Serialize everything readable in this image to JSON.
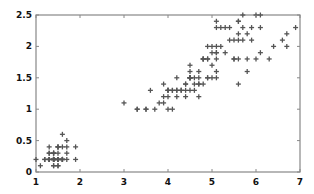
{
  "chart_data": {
    "type": "scatter",
    "title": "",
    "xlabel": "",
    "ylabel": "",
    "xlim": [
      1,
      7
    ],
    "ylim": [
      0,
      2.5
    ],
    "grid": false,
    "legend": null,
    "marker": "+",
    "marker_color": "#555555",
    "axis_color": "#888888",
    "x_ticks": [
      1,
      2,
      3,
      4,
      5,
      6,
      7
    ],
    "x_tick_labels": [
      "1",
      "2",
      "3",
      "4",
      "5",
      "6",
      "7"
    ],
    "y_ticks": [
      0,
      0.5,
      1,
      1.5,
      2,
      2.5
    ],
    "y_tick_labels": [
      "0",
      "0.5",
      "1",
      "1.5",
      "2",
      "2.5"
    ],
    "series": [
      {
        "name": "points",
        "x": [
          1.4,
          1.4,
          1.3,
          1.5,
          1.4,
          1.7,
          1.4,
          1.5,
          1.4,
          1.5,
          1.5,
          1.6,
          1.4,
          1.1,
          1.2,
          1.5,
          1.3,
          1.4,
          1.7,
          1.5,
          1.7,
          1.5,
          1.0,
          1.7,
          1.9,
          1.6,
          1.6,
          1.5,
          1.4,
          1.6,
          1.6,
          1.5,
          1.5,
          1.4,
          1.5,
          1.2,
          1.3,
          1.4,
          1.3,
          1.5,
          1.3,
          1.3,
          1.3,
          1.6,
          1.9,
          1.4,
          1.6,
          1.4,
          1.5,
          1.4,
          4.7,
          4.5,
          4.9,
          4.0,
          4.6,
          4.5,
          4.7,
          3.3,
          4.6,
          3.9,
          3.5,
          4.2,
          4.0,
          4.7,
          3.6,
          4.4,
          4.5,
          4.1,
          4.5,
          3.9,
          4.8,
          4.0,
          4.9,
          4.7,
          4.3,
          4.4,
          4.8,
          5.0,
          4.5,
          3.5,
          3.8,
          3.7,
          3.9,
          5.1,
          4.5,
          4.5,
          4.7,
          4.4,
          4.1,
          4.0,
          4.4,
          4.6,
          4.0,
          3.3,
          4.2,
          4.2,
          4.2,
          4.3,
          3.0,
          4.1,
          6.0,
          5.1,
          5.9,
          5.6,
          5.8,
          6.6,
          4.5,
          6.3,
          5.8,
          6.1,
          5.1,
          5.3,
          5.5,
          5.0,
          5.1,
          5.3,
          5.5,
          6.7,
          6.9,
          5.0,
          5.7,
          4.9,
          6.7,
          4.9,
          5.7,
          6.0,
          4.8,
          4.9,
          5.6,
          5.8,
          6.1,
          6.4,
          5.6,
          5.1,
          5.6,
          6.1,
          5.6,
          5.5,
          4.8,
          5.4,
          5.6,
          5.1,
          5.1,
          5.9,
          5.7,
          5.2,
          5.0,
          5.2,
          5.4,
          5.1
        ],
        "y": [
          0.2,
          0.2,
          0.2,
          0.2,
          0.2,
          0.4,
          0.3,
          0.2,
          0.2,
          0.1,
          0.2,
          0.2,
          0.1,
          0.1,
          0.2,
          0.4,
          0.4,
          0.3,
          0.3,
          0.3,
          0.2,
          0.4,
          0.2,
          0.5,
          0.2,
          0.2,
          0.4,
          0.2,
          0.2,
          0.2,
          0.2,
          0.4,
          0.1,
          0.2,
          0.2,
          0.2,
          0.2,
          0.1,
          0.2,
          0.2,
          0.3,
          0.3,
          0.2,
          0.6,
          0.4,
          0.3,
          0.2,
          0.2,
          0.2,
          0.2,
          1.4,
          1.5,
          1.5,
          1.3,
          1.5,
          1.3,
          1.6,
          1.0,
          1.3,
          1.4,
          1.0,
          1.5,
          1.0,
          1.4,
          1.3,
          1.4,
          1.5,
          1.0,
          1.5,
          1.1,
          1.8,
          1.3,
          1.5,
          1.2,
          1.3,
          1.4,
          1.4,
          1.7,
          1.5,
          1.0,
          1.1,
          1.0,
          1.2,
          1.6,
          1.5,
          1.6,
          1.5,
          1.3,
          1.3,
          1.3,
          1.2,
          1.4,
          1.2,
          1.0,
          1.3,
          1.2,
          1.3,
          1.3,
          1.1,
          1.3,
          2.5,
          1.9,
          2.1,
          1.8,
          2.2,
          2.1,
          1.7,
          1.8,
          1.8,
          2.5,
          2.0,
          1.9,
          2.1,
          2.0,
          2.4,
          2.3,
          1.8,
          2.2,
          2.3,
          1.5,
          2.3,
          2.0,
          2.0,
          1.8,
          2.1,
          1.8,
          1.8,
          1.8,
          2.1,
          1.6,
          1.9,
          2.0,
          2.2,
          1.5,
          1.4,
          2.3,
          2.4,
          1.8,
          1.8,
          2.1,
          2.4,
          2.3,
          1.9,
          2.3,
          2.5,
          2.3,
          1.9,
          2.0,
          2.3,
          1.8
        ]
      }
    ]
  }
}
